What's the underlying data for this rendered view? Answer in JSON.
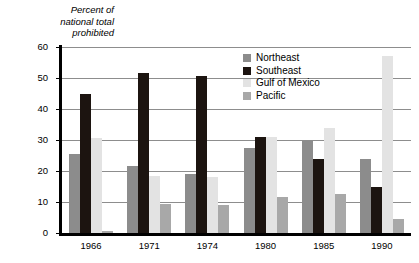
{
  "chart_data": {
    "type": "bar",
    "title": "",
    "subtitle": "",
    "ylabel": "Percent of\nnational total\nprohibited",
    "xlabel": "",
    "ylim": [
      0,
      60
    ],
    "ytick_values": [
      60,
      50,
      40,
      30,
      20,
      10,
      0
    ],
    "ytick_labels": [
      "60",
      "50",
      "40",
      "30",
      "20",
      "10",
      "0"
    ],
    "grid": true,
    "grid_axis": "y",
    "legend_position": "inside upper-center",
    "categories": [
      "1966",
      "1971",
      "1974",
      "1980",
      "1985",
      "1990"
    ],
    "series": [
      {
        "name": "Northeast",
        "color": "#8c8c8c",
        "values": [
          25.5,
          21.5,
          19.0,
          27.5,
          30.0,
          24.0
        ]
      },
      {
        "name": "Southeast",
        "color": "#1c1410",
        "values": [
          45.0,
          51.5,
          50.5,
          31.0,
          24.0,
          15.0
        ]
      },
      {
        "name": "Gulf of Mexico",
        "color": "#e3e3e3",
        "values": [
          30.5,
          18.5,
          18.0,
          31.0,
          34.0,
          57.0
        ]
      },
      {
        "name": "Pacific",
        "color": "#a8a8a8",
        "values": [
          0.5,
          9.5,
          9.0,
          11.5,
          12.5,
          4.5
        ]
      }
    ]
  },
  "legend": {
    "items": [
      {
        "label": "Northeast"
      },
      {
        "label": "Southeast"
      },
      {
        "label": "Gulf of Mexico"
      },
      {
        "label": "Pacific"
      }
    ]
  },
  "colors": {
    "axis": "#000000",
    "gridline": "#8d8d8d",
    "background": "#ffffff",
    "text": "#000000"
  }
}
